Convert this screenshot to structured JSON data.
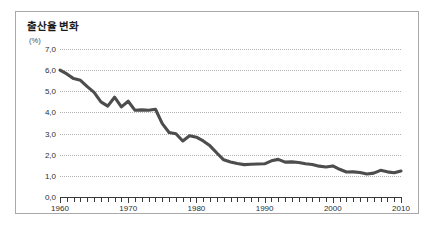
{
  "figure": {
    "title": "출산율 변화",
    "unit_label": "(%)",
    "background_color": "#ffffff",
    "border_color": "#a9a9a9",
    "line_color": "#4d4d4d",
    "grid_color": "#b2b2b2"
  },
  "chart_data": {
    "type": "line",
    "title": "출산율 변화",
    "xlabel": "",
    "ylabel": "(%)",
    "xlim": [
      1960,
      2010
    ],
    "ylim": [
      0.0,
      7.0
    ],
    "grid": true,
    "legend": "none",
    "ytick_labels": [
      "7,0",
      "6,0",
      "5,0",
      "4,0",
      "3,0",
      "2,0",
      "1,0",
      "0,0"
    ],
    "ytick_values": [
      7.0,
      6.0,
      5.0,
      4.0,
      3.0,
      2.0,
      1.0,
      0.0
    ],
    "xtick_labels": [
      "1960",
      "1970",
      "1980",
      "1990",
      "2000",
      "2010"
    ],
    "xtick_values": [
      1960,
      1970,
      1980,
      1990,
      2000,
      2010
    ],
    "minor_xtick_interval": 1,
    "series": [
      {
        "name": "출산율",
        "x": [
          1960,
          1961,
          1962,
          1963,
          1964,
          1965,
          1966,
          1967,
          1968,
          1969,
          1970,
          1971,
          1972,
          1973,
          1974,
          1975,
          1976,
          1977,
          1978,
          1979,
          1980,
          1981,
          1982,
          1983,
          1984,
          1985,
          1986,
          1987,
          1988,
          1989,
          1990,
          1991,
          1992,
          1993,
          1994,
          1995,
          1996,
          1997,
          1998,
          1999,
          2000,
          2001,
          2002,
          2003,
          2004,
          2005,
          2006,
          2007,
          2008,
          2009,
          2010
        ],
        "values": [
          6.0,
          5.82,
          5.6,
          5.52,
          5.22,
          4.95,
          4.5,
          4.3,
          4.72,
          4.26,
          4.53,
          4.1,
          4.12,
          4.1,
          4.15,
          3.47,
          3.05,
          2.99,
          2.65,
          2.9,
          2.83,
          2.65,
          2.42,
          2.08,
          1.76,
          1.66,
          1.58,
          1.53,
          1.55,
          1.56,
          1.57,
          1.71,
          1.78,
          1.65,
          1.66,
          1.63,
          1.57,
          1.54,
          1.46,
          1.42,
          1.47,
          1.31,
          1.18,
          1.19,
          1.16,
          1.09,
          1.13,
          1.26,
          1.19,
          1.15,
          1.23
        ]
      }
    ]
  }
}
